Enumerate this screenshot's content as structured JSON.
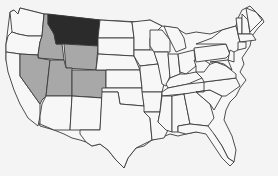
{
  "map": {
    "title": "United States map — highlighted states",
    "colors": {
      "background": "#f4f4f4",
      "default_fill": "#f7f7f7",
      "primary_highlight": "#2b2b2b",
      "secondary_highlight": "#a8a8a8",
      "border": "#3a3a3a"
    },
    "highlighted": {
      "primary": [
        "Montana"
      ],
      "secondary": [
        "Idaho",
        "Wyoming",
        "Nevada",
        "Utah",
        "Colorado"
      ]
    },
    "states": [
      {
        "name": "Washington",
        "fill": "default"
      },
      {
        "name": "Oregon",
        "fill": "default"
      },
      {
        "name": "California",
        "fill": "default"
      },
      {
        "name": "Idaho",
        "fill": "secondary"
      },
      {
        "name": "Nevada",
        "fill": "secondary"
      },
      {
        "name": "Montana",
        "fill": "primary"
      },
      {
        "name": "Wyoming",
        "fill": "secondary"
      },
      {
        "name": "Utah",
        "fill": "secondary"
      },
      {
        "name": "Colorado",
        "fill": "secondary"
      },
      {
        "name": "Arizona",
        "fill": "default"
      },
      {
        "name": "New Mexico",
        "fill": "default"
      }
    ]
  }
}
